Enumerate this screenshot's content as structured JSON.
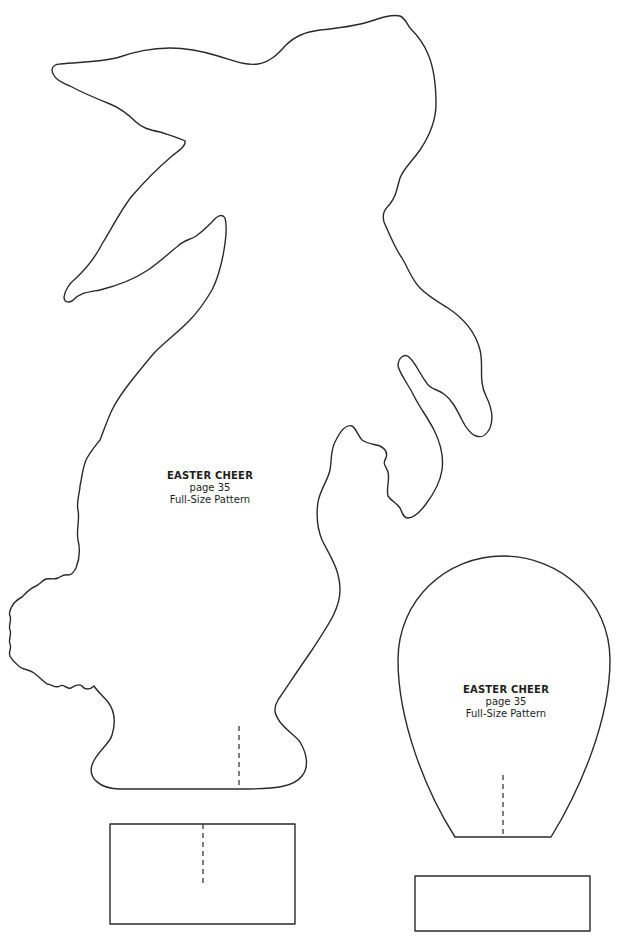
{
  "document": {
    "type": "craft-pattern-sheet",
    "background": "#ffffff",
    "line_color": "#2a2a2a"
  },
  "pieces": [
    {
      "name": "bunny",
      "label": {
        "title": "EASTER CHEER",
        "page": "page 35",
        "subtitle": "Full-Size Pattern"
      },
      "has_fold_line": true
    },
    {
      "name": "egg",
      "label": {
        "title": "EASTER CHEER",
        "page": "page 35",
        "subtitle": "Full-Size Pattern"
      },
      "has_fold_line": true
    },
    {
      "name": "bunny-base-rectangle",
      "has_fold_line": true
    },
    {
      "name": "egg-base-rectangle",
      "has_fold_line": false
    }
  ]
}
